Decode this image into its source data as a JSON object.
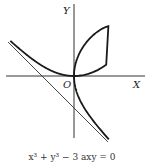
{
  "diagram": {
    "caption": "x³ + y³ − 3 axy = 0",
    "axis_labels": {
      "x": "X",
      "y": "Y",
      "origin": "O"
    },
    "curve": {
      "equation": "x^3 + y^3 - 3axy = 0",
      "parameter_a": 1
    },
    "asymptote": {
      "equation": "x + y + a = 0"
    },
    "colors": {
      "curve": "#1a1a1a",
      "axes": "#333333",
      "asymptote": "#333333"
    }
  }
}
